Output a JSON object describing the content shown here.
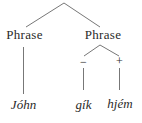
{
  "figure": {
    "kind": "metrical-syntax-tree",
    "colors": {
      "background": "#ffffff",
      "line": "#777777",
      "text": "#2a2a2a"
    },
    "nodes": {
      "phrase_left": {
        "label": "Phrase"
      },
      "phrase_right": {
        "label": "Phrase"
      },
      "minus": {
        "label": "−"
      },
      "plus": {
        "label": "+"
      },
      "word_left": {
        "label": "Jóhn"
      },
      "word_mid": {
        "label": "gík"
      },
      "word_right": {
        "label": "hjém"
      }
    }
  }
}
